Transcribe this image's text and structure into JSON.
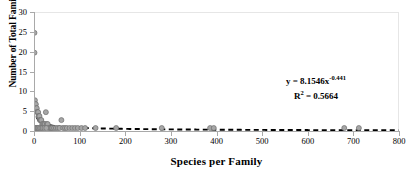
{
  "chart_data": {
    "type": "scatter",
    "title": "",
    "xlabel": "Species per Family",
    "ylabel": "Number of Total Families",
    "xlim": [
      0,
      800
    ],
    "ylim": [
      0,
      30
    ],
    "xticks": [
      0,
      100,
      200,
      300,
      400,
      500,
      600,
      700,
      800
    ],
    "yticks": [
      0,
      5,
      10,
      15,
      20,
      25,
      30
    ],
    "grid": false,
    "legend": null,
    "marker_fill_color": "#a6a6a6",
    "marker_edge_color": "#6e6e6e",
    "trendline_color": "#000000",
    "trendline_style": "dashed",
    "annotations": {
      "equation": "y = 8.1546x",
      "equation_exponent": "-0.441",
      "r_squared_label": "R",
      "r_squared_sup": "2",
      "r_squared_value": "= 0.5664"
    },
    "trendline": {
      "form": "power",
      "a": 8.1546,
      "b": -0.441,
      "r2": 0.5664
    },
    "points": [
      [
        1,
        25
      ],
      [
        1,
        20
      ],
      [
        2,
        8
      ],
      [
        3,
        7
      ],
      [
        4,
        7
      ],
      [
        5,
        6
      ],
      [
        6,
        6
      ],
      [
        7,
        5
      ],
      [
        8,
        5
      ],
      [
        9,
        5
      ],
      [
        10,
        4
      ],
      [
        11,
        4
      ],
      [
        12,
        4
      ],
      [
        13,
        3
      ],
      [
        14,
        3
      ],
      [
        15,
        3
      ],
      [
        16,
        3
      ],
      [
        18,
        2
      ],
      [
        20,
        2
      ],
      [
        22,
        2
      ],
      [
        24,
        2
      ],
      [
        26,
        5
      ],
      [
        28,
        2
      ],
      [
        30,
        2
      ],
      [
        32,
        1
      ],
      [
        35,
        1
      ],
      [
        38,
        1
      ],
      [
        40,
        1
      ],
      [
        44,
        1
      ],
      [
        48,
        1
      ],
      [
        52,
        1
      ],
      [
        56,
        1
      ],
      [
        60,
        3
      ],
      [
        64,
        1
      ],
      [
        68,
        1
      ],
      [
        72,
        1
      ],
      [
        78,
        1
      ],
      [
        84,
        1
      ],
      [
        90,
        1
      ],
      [
        96,
        1
      ],
      [
        104,
        1
      ],
      [
        112,
        1
      ],
      [
        135,
        1
      ],
      [
        180,
        1
      ],
      [
        280,
        1
      ],
      [
        386,
        1
      ],
      [
        394,
        1
      ],
      [
        680,
        1
      ],
      [
        712,
        1
      ],
      [
        2,
        1
      ],
      [
        4,
        1
      ],
      [
        6,
        1
      ],
      [
        8,
        1
      ],
      [
        10,
        1
      ],
      [
        13,
        1
      ],
      [
        16,
        1
      ],
      [
        19,
        1
      ],
      [
        23,
        1
      ],
      [
        27,
        1
      ]
    ]
  },
  "axis": {
    "y_tick_labels": [
      "0",
      "5",
      "10",
      "15",
      "20",
      "25",
      "30"
    ],
    "x_tick_labels": [
      "0",
      "100",
      "200",
      "300",
      "400",
      "500",
      "600",
      "700",
      "800"
    ]
  }
}
